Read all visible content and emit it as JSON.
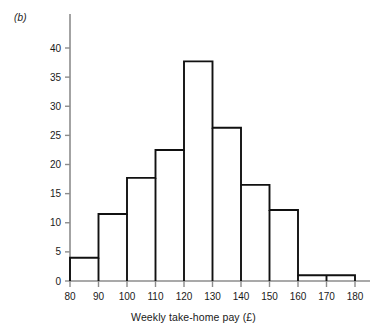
{
  "figure": {
    "panel_label": "(b)",
    "axis_title_x": "Weekly take-home pay (£)",
    "axis_title_y": "",
    "bar_stroke_color": "#111111",
    "bar_fill_color": "#ffffff",
    "axis_color": "#8c8c8c",
    "text_color": "#1a1a1a"
  },
  "chart_data": {
    "type": "bar",
    "title": "(b)",
    "xlabel": "Weekly take-home pay (£)",
    "ylabel": "",
    "xlim": [
      80,
      180
    ],
    "ylim": [
      0,
      41
    ],
    "grid": false,
    "legend": "none",
    "bin_width": 10,
    "bin_edges": [
      80,
      90,
      100,
      110,
      120,
      130,
      140,
      150,
      160,
      170,
      180
    ],
    "categories": [
      "80-90",
      "90-100",
      "100-110",
      "110-120",
      "120-130",
      "130-140",
      "140-150",
      "150-160",
      "160-170",
      "170-180"
    ],
    "values": [
      4,
      11.5,
      17.7,
      22.5,
      37.7,
      26.3,
      16.5,
      12.2,
      1,
      1
    ],
    "xticks": [
      80,
      90,
      100,
      110,
      120,
      130,
      140,
      150,
      160,
      170,
      180
    ],
    "xtick_labels": [
      "80",
      "90",
      "100",
      "110",
      "120",
      "130",
      "140",
      "150",
      "160",
      "170",
      "180"
    ],
    "yticks": [
      0,
      5,
      10,
      15,
      20,
      25,
      30,
      35,
      40
    ],
    "ytick_labels": [
      "0",
      "5",
      "10",
      "15",
      "20",
      "25",
      "30",
      "35",
      "40"
    ]
  }
}
